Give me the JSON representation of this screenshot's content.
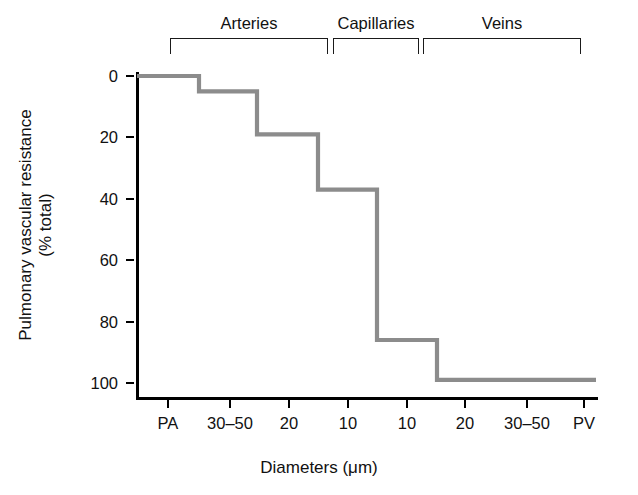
{
  "chart_data": {
    "type": "line",
    "subtype": "step",
    "title": "",
    "xlabel": "Diameters (μm)",
    "ylabel": "Pulmonary vascular resistance (% total)",
    "ylabel_line1": "Pulmonary vascular resistance",
    "ylabel_line2": "(% total)",
    "xticklabels": [
      "PA",
      "30–50",
      "20",
      "10",
      "10",
      "20",
      "30–50",
      "PV"
    ],
    "yticklabels": [
      "0",
      "20",
      "40",
      "60",
      "80",
      "100"
    ],
    "yticks": [
      0,
      20,
      40,
      60,
      80,
      100
    ],
    "ylim": [
      0,
      100
    ],
    "y_axis_inverted": true,
    "grid": false,
    "legend": false,
    "line_color": "#8c8c8c",
    "axis_color": "#000000",
    "categories": [
      "PA",
      "30–50",
      "20",
      "10",
      "10",
      "20",
      "30–50",
      "PV"
    ],
    "values": [
      0,
      5,
      19,
      37,
      86,
      99,
      99,
      99
    ],
    "steps": [
      {
        "segment": 1,
        "x_from": "PA",
        "x_to": "30–50",
        "value": 0
      },
      {
        "segment": 2,
        "x_from": "30–50",
        "x_to": "20",
        "value": 5
      },
      {
        "segment": 3,
        "x_from": "20",
        "x_to": "10",
        "value": 19
      },
      {
        "segment": 4,
        "x_from": "10",
        "x_to": "10",
        "value": 37
      },
      {
        "segment": 5,
        "x_from": "10",
        "x_to": "20",
        "value": 86
      },
      {
        "segment": 6,
        "x_from": "20",
        "x_to": "PV",
        "value": 99
      }
    ],
    "annotations": [
      {
        "label": "Arteries",
        "kind": "bracket",
        "span": [
          "PA",
          "10"
        ]
      },
      {
        "label": "Capillaries",
        "kind": "bracket",
        "span": [
          "10",
          "10"
        ]
      },
      {
        "label": "Veins",
        "kind": "bracket",
        "span": [
          "20",
          "PV"
        ]
      }
    ]
  },
  "groups": [
    {
      "label": "Arteries"
    },
    {
      "label": "Capillaries"
    },
    {
      "label": "Veins"
    }
  ]
}
